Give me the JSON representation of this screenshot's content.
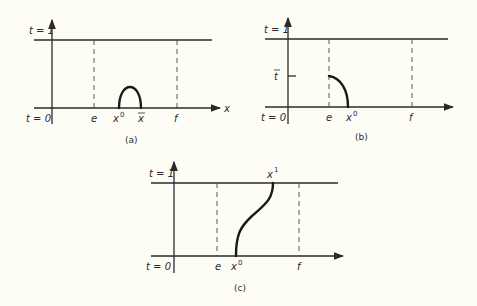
{
  "panels": [
    {
      "id": "a",
      "caption": "(a)",
      "t_top_label": "t = 1",
      "t_bottom_label": "t = 0",
      "x_axis_label": "x",
      "markers": [
        "e",
        "x",
        "x̄",
        "f"
      ],
      "marker_e": "e",
      "marker_x0_base": "x",
      "marker_x0_sup": "0",
      "marker_xbar": "x",
      "marker_f": "f",
      "curve": "bump from x0 to x-bar"
    },
    {
      "id": "b",
      "caption": "(b)",
      "t_top_label": "t = 1",
      "t_bottom_label": "t = 0",
      "t_mid_label": "t",
      "marker_e": "e",
      "marker_x0_base": "x",
      "marker_x0_sup": "0",
      "marker_f": "f",
      "curve": "quarter arc from (e, t-bar) to (x0, 0)"
    },
    {
      "id": "c",
      "caption": "(c)",
      "t_top_label": "t = 1",
      "t_bottom_label": "t = 0",
      "marker_e": "e",
      "marker_x0_base": "x",
      "marker_x0_sup": "0",
      "marker_x1_base": "x",
      "marker_x1_sup": "1",
      "marker_f": "f",
      "curve": "S-curve from x0 at t=0 to x1 at t=1"
    }
  ]
}
